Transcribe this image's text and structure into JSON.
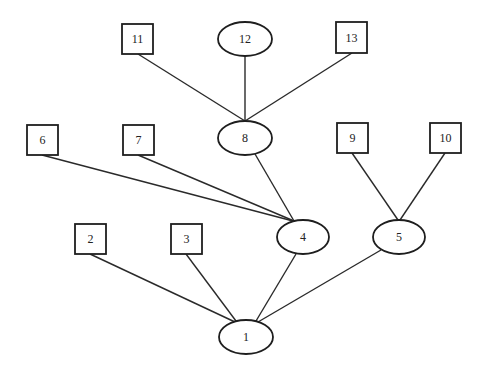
{
  "diagram": {
    "type": "tree",
    "root": "1",
    "colors": {
      "stroke": "#1e1e1e",
      "background": "#ffffff"
    },
    "nodes": [
      {
        "id": "1",
        "label": "1",
        "shape": "ellipse",
        "cx": 246,
        "cy": 337,
        "rx": 27,
        "ry": 17
      },
      {
        "id": "2",
        "label": "2",
        "shape": "box",
        "x": 75,
        "y": 224,
        "w": 31,
        "h": 30
      },
      {
        "id": "3",
        "label": "3",
        "shape": "box",
        "x": 171,
        "y": 224,
        "w": 31,
        "h": 30
      },
      {
        "id": "4",
        "label": "4",
        "shape": "ellipse",
        "cx": 303,
        "cy": 237,
        "rx": 26,
        "ry": 17
      },
      {
        "id": "5",
        "label": "5",
        "shape": "ellipse",
        "cx": 399,
        "cy": 237,
        "rx": 26,
        "ry": 17
      },
      {
        "id": "6",
        "label": "6",
        "shape": "box",
        "x": 27,
        "y": 125,
        "w": 31,
        "h": 30
      },
      {
        "id": "7",
        "label": "7",
        "shape": "box",
        "x": 123,
        "y": 125,
        "w": 31,
        "h": 30
      },
      {
        "id": "8",
        "label": "8",
        "shape": "ellipse",
        "cx": 245,
        "cy": 138,
        "rx": 27,
        "ry": 17
      },
      {
        "id": "9",
        "label": "9",
        "shape": "box",
        "x": 337,
        "y": 123,
        "w": 31,
        "h": 30
      },
      {
        "id": "10",
        "label": "10",
        "shape": "box",
        "x": 430,
        "y": 123,
        "w": 31,
        "h": 30
      },
      {
        "id": "11",
        "label": "11",
        "shape": "box",
        "x": 122,
        "y": 24,
        "w": 31,
        "h": 30
      },
      {
        "id": "12",
        "label": "12",
        "shape": "ellipse",
        "cx": 245,
        "cy": 39,
        "rx": 27,
        "ry": 17
      },
      {
        "id": "13",
        "label": "13",
        "shape": "box",
        "x": 336,
        "y": 22,
        "w": 31,
        "h": 31
      }
    ],
    "edges": [
      {
        "from": "2",
        "to": "1",
        "x1": 90,
        "y1": 254,
        "x2": 235,
        "y2": 322
      },
      {
        "from": "3",
        "to": "1",
        "x1": 186,
        "y1": 254,
        "x2": 236,
        "y2": 321
      },
      {
        "from": "4",
        "to": "1",
        "x1": 296,
        "y1": 254,
        "x2": 256,
        "y2": 321
      },
      {
        "from": "5",
        "to": "1",
        "x1": 381,
        "y1": 250,
        "x2": 258,
        "y2": 322
      },
      {
        "from": "6",
        "to": "4",
        "x1": 42,
        "y1": 155,
        "x2": 293,
        "y2": 221
      },
      {
        "from": "7",
        "to": "4",
        "x1": 138,
        "y1": 155,
        "x2": 294,
        "y2": 221
      },
      {
        "from": "8",
        "to": "4",
        "x1": 255,
        "y1": 154,
        "x2": 294,
        "y2": 221
      },
      {
        "from": "9",
        "to": "5",
        "x1": 352,
        "y1": 153,
        "x2": 398,
        "y2": 220
      },
      {
        "from": "10",
        "to": "5",
        "x1": 445,
        "y1": 153,
        "x2": 400,
        "y2": 220
      },
      {
        "from": "11",
        "to": "8",
        "x1": 138,
        "y1": 54,
        "x2": 245,
        "y2": 121
      },
      {
        "from": "12",
        "to": "8",
        "x1": 245,
        "y1": 56,
        "x2": 245,
        "y2": 121
      },
      {
        "from": "13",
        "to": "8",
        "x1": 352,
        "y1": 53,
        "x2": 245,
        "y2": 121
      }
    ]
  }
}
